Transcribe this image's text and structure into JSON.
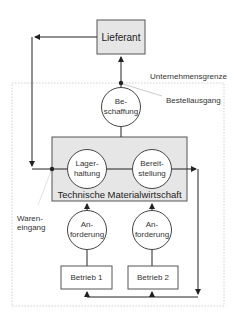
{
  "diagram": {
    "supplier": "Lieferant",
    "boundary_label": "Unternehmensgrenze",
    "order_out_label": "Bestellausgang",
    "goods_in_label": [
      "Waren-",
      "eingang"
    ],
    "procurement": [
      "Be-",
      "schaffung"
    ],
    "tmw_label": "Technische Materialwirtschaft",
    "storage": [
      "Lager-",
      "haltung"
    ],
    "provision": [
      "Bereit-",
      "stellung"
    ],
    "request1": [
      "An-",
      "forderung"
    ],
    "request2": [
      "An-",
      "forderung"
    ],
    "plant1": "Betrieb 1",
    "plant2": "Betrieb 2",
    "colors": {
      "box_fill": "#e6e6e6",
      "line": "#333333",
      "boundary": "#bbbbbb"
    }
  }
}
